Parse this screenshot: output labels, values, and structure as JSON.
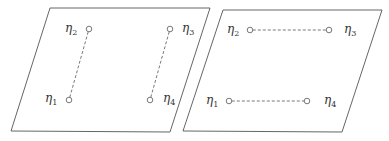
{
  "diagram": {
    "type": "two-planes-node-pairing",
    "colors": {
      "stroke": "#555555",
      "text": "#333333",
      "background": "#ffffff"
    },
    "panels": [
      {
        "id": "left",
        "plane": {
          "points": [
            [
              50,
              8
            ],
            [
              210,
              8
            ],
            [
              170,
              132
            ],
            [
              11,
              131
            ]
          ]
        },
        "nodes": [
          {
            "id": "eta1",
            "symbol": "η",
            "sub": "1",
            "cx": 69,
            "cy": 100,
            "lx": 45,
            "ly": 102
          },
          {
            "id": "eta2",
            "symbol": "η",
            "sub": "2",
            "cx": 89,
            "cy": 29,
            "lx": 65,
            "ly": 32
          },
          {
            "id": "eta3",
            "symbol": "η",
            "sub": "3",
            "cx": 170,
            "cy": 29,
            "lx": 182,
            "ly": 32
          },
          {
            "id": "eta4",
            "symbol": "η",
            "sub": "4",
            "cx": 150,
            "cy": 100,
            "lx": 163,
            "ly": 102
          }
        ],
        "edges": [
          {
            "from": "eta1",
            "to": "eta2",
            "style": "dashed"
          },
          {
            "from": "eta4",
            "to": "eta3",
            "style": "dashed"
          }
        ]
      },
      {
        "id": "right",
        "plane": {
          "points": [
            [
              223,
              10
            ],
            [
              382,
              10
            ],
            [
              342,
              132
            ],
            [
              183,
              131
            ]
          ]
        },
        "nodes": [
          {
            "id": "eta1",
            "symbol": "η",
            "sub": "1",
            "cx": 229,
            "cy": 101,
            "lx": 206,
            "ly": 104
          },
          {
            "id": "eta2",
            "symbol": "η",
            "sub": "2",
            "cx": 250,
            "cy": 30,
            "lx": 227,
            "ly": 33
          },
          {
            "id": "eta3",
            "symbol": "η",
            "sub": "3",
            "cx": 329,
            "cy": 30,
            "lx": 344,
            "ly": 33
          },
          {
            "id": "eta4",
            "symbol": "η",
            "sub": "4",
            "cx": 307,
            "cy": 101,
            "lx": 324,
            "ly": 104
          }
        ],
        "edges": [
          {
            "from": "eta2",
            "to": "eta3",
            "style": "dashed"
          },
          {
            "from": "eta1",
            "to": "eta4",
            "style": "dashed"
          }
        ]
      }
    ]
  }
}
